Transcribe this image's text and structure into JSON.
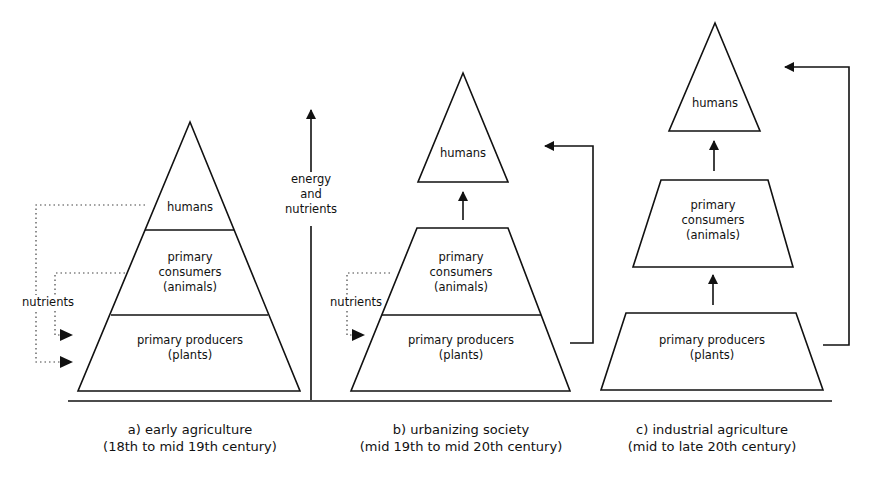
{
  "axis": {
    "label_line1": "energy",
    "label_line2": "and",
    "label_line3": "nutrients"
  },
  "panels": [
    {
      "id": "a",
      "caption_line1": "a) early agriculture",
      "caption_line2": "(18th to mid 19th century)",
      "levels": {
        "top": "humans",
        "middle_1": "primary",
        "middle_2": "consumers",
        "middle_3": "(animals)",
        "bottom_1": "primary producers",
        "bottom_2": "(plants)"
      },
      "side_label": "nutrients"
    },
    {
      "id": "b",
      "caption_line1": "b) urbanizing society",
      "caption_line2": "(mid 19th to mid 20th century)",
      "levels": {
        "top": "humans",
        "middle_1": "primary",
        "middle_2": "consumers",
        "middle_3": "(animals)",
        "bottom_1": "primary producers",
        "bottom_2": "(plants)"
      },
      "side_label": "nutrients"
    },
    {
      "id": "c",
      "caption_line1": "c) industrial agriculture",
      "caption_line2": "(mid to late  20th century)",
      "levels": {
        "top": "humans",
        "middle_1": "primary",
        "middle_2": "consumers",
        "middle_3": "(animals)",
        "bottom_1": "primary producers",
        "bottom_2": "(plants)"
      }
    }
  ]
}
